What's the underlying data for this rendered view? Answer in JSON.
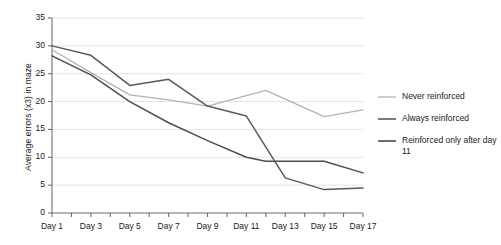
{
  "chart_data": {
    "type": "line",
    "title": "",
    "xlabel": "",
    "ylabel": "Average errors (x3) in maze",
    "x": [
      1,
      2,
      3,
      4,
      5,
      6,
      7,
      8,
      9,
      10,
      11,
      12,
      13,
      14,
      15,
      16,
      17
    ],
    "categories": [
      "Day 1",
      "Day 2",
      "Day 3",
      "Day 4",
      "Day 5",
      "Day 6",
      "Day 7",
      "Day 8",
      "Day 9",
      "Day 10",
      "Day 11",
      "Day 12",
      "Day 13",
      "Day 14",
      "Day 15",
      "Day 16",
      "Day 17"
    ],
    "xtick_labels": [
      "Day 1",
      "Day 3",
      "Day 5",
      "Day 7",
      "Day 9",
      "Day 11",
      "Day 13",
      "Day 15",
      "Day 17"
    ],
    "xtick_values": [
      1,
      3,
      5,
      7,
      9,
      11,
      13,
      15,
      17
    ],
    "ytick_labels": [
      "0",
      "5",
      "10",
      "15",
      "20",
      "25",
      "30",
      "35"
    ],
    "ytick_values": [
      0,
      5,
      10,
      15,
      20,
      25,
      30,
      35
    ],
    "xlim": [
      1,
      17
    ],
    "ylim": [
      0,
      35
    ],
    "grid": "horizontal",
    "legend_position": "right",
    "series": [
      {
        "name": "Never reinforced",
        "color": "#b3b3b3",
        "x": [
          1,
          3,
          5,
          7,
          9,
          12,
          15,
          17
        ],
        "values": [
          29.3,
          25.2,
          21.2,
          20.3,
          19.2,
          22.0,
          17.3,
          18.5
        ]
      },
      {
        "name": "Always reinforced",
        "color": "#595959",
        "x": [
          1,
          3,
          5,
          7,
          9,
          11,
          13,
          15,
          17
        ],
        "values": [
          30.0,
          28.3,
          22.9,
          24.0,
          19.2,
          17.4,
          6.3,
          4.2,
          4.5
        ]
      },
      {
        "name": "Reinforced only after day 11",
        "color": "#4d4d4d",
        "x": [
          1,
          3,
          5,
          7,
          9,
          11,
          12,
          15,
          17
        ],
        "values": [
          28.2,
          24.8,
          20.0,
          16.2,
          13.0,
          10.0,
          9.3,
          9.3,
          7.2
        ]
      }
    ]
  },
  "legend": {
    "items": [
      {
        "label": "Never reinforced"
      },
      {
        "label": "Always reinforced"
      },
      {
        "label": "Reinforced only after day 11"
      }
    ]
  },
  "style": {
    "axis_color": "#6e6e6e",
    "grid_color": "#e4e4e4",
    "text_color": "#1a1a1a",
    "background": "#ffffff"
  }
}
